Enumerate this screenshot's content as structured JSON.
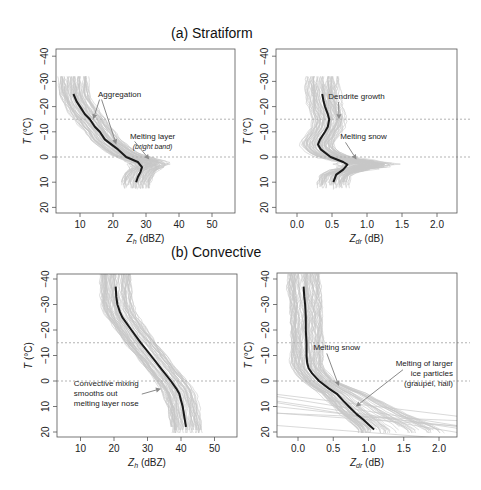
{
  "titles": {
    "top": "(a) Stratiform",
    "bottom": "(b) Convective"
  },
  "colors": {
    "mean_line": "#1a1a1a",
    "ensemble_lines": "#c8c8c8",
    "reference_lines": "#aaaaaa",
    "arrow": "#8a8a8a",
    "axis": "#555555",
    "text": "#222222"
  },
  "chart_data": [
    {
      "id": "stratiform-zh",
      "type": "line",
      "title": "(a) Stratiform",
      "xlabel": "Z_h (dBZ)",
      "xlabel_main": "Z",
      "xlabel_sub": "h",
      "xlabel_unit": " (dBZ)",
      "ylabel": "T (°C)",
      "xlim": [
        3,
        57
      ],
      "ylim": [
        22,
        -43
      ],
      "x_ticks": [
        10,
        20,
        30,
        40,
        50
      ],
      "x_tick_labels": [
        "10",
        "20",
        "30",
        "40",
        "50"
      ],
      "y_ticks": [
        -40,
        -30,
        -20,
        -10,
        0,
        10,
        20
      ],
      "y_tick_labels": [
        "-40",
        "-30",
        "-20",
        "-10",
        "0",
        "10",
        "20"
      ],
      "reference_lines_T": [
        -15,
        0
      ],
      "grid": false,
      "series": [
        {
          "name": "mean profile",
          "T": [
            -25,
            -22,
            -20,
            -17,
            -15,
            -12,
            -10,
            -7,
            -5,
            -3,
            0,
            2,
            4,
            6,
            8,
            10
          ],
          "values": [
            8,
            9,
            10,
            11.5,
            13,
            14.5,
            16,
            17.5,
            19.5,
            21.5,
            24,
            27.5,
            28.8,
            28.3,
            27.5,
            27
          ]
        }
      ],
      "ensemble_spread": {
        "T_range": [
          -32,
          13
        ],
        "x_range": [
          5,
          40
        ]
      },
      "annotations": [
        {
          "text": "Aggregation",
          "x": 22,
          "y": -24,
          "arrows_to": [
            [
              14,
              -15
            ],
            [
              21,
              -5
            ]
          ]
        },
        {
          "text": "Melting layer",
          "subtext": "(bright band)",
          "x": 32,
          "y": -7,
          "arrows_to": [
            [
              31,
              1
            ]
          ]
        }
      ]
    },
    {
      "id": "stratiform-zdr",
      "type": "line",
      "title": "(a) Stratiform",
      "xlabel": "Z_dr (dB)",
      "xlabel_main": "Z",
      "xlabel_sub": "dr",
      "xlabel_unit": " (dB)",
      "ylabel": "T (°C)",
      "xlim": [
        -0.3,
        2.3
      ],
      "ylim": [
        22,
        -43
      ],
      "x_ticks": [
        0.0,
        0.5,
        1.0,
        1.5,
        2.0
      ],
      "x_tick_labels": [
        "0.0",
        "0.5",
        "1.0",
        "1.5",
        "2.0"
      ],
      "y_ticks": [
        -40,
        -30,
        -20,
        -10,
        0,
        10,
        20
      ],
      "y_tick_labels": [
        "-40",
        "-30",
        "-20",
        "-10",
        "0",
        "10",
        "20"
      ],
      "reference_lines_T": [
        -15,
        0
      ],
      "grid": false,
      "series": [
        {
          "name": "mean profile",
          "T": [
            -25,
            -22,
            -20,
            -17,
            -15,
            -12,
            -10,
            -7,
            -5,
            -3,
            0,
            2,
            3,
            5,
            7,
            10
          ],
          "values": [
            0.36,
            0.38,
            0.4,
            0.44,
            0.46,
            0.44,
            0.4,
            0.33,
            0.3,
            0.34,
            0.48,
            0.66,
            0.72,
            0.66,
            0.56,
            0.52
          ]
        }
      ],
      "ensemble_spread": {
        "T_range": [
          -32,
          13
        ],
        "x_range": [
          0.0,
          1.5
        ]
      },
      "annotations": [
        {
          "text": "Dendrite growth",
          "x": 0.85,
          "y": -23,
          "arrows_to": [
            [
              0.6,
              -15
            ]
          ]
        },
        {
          "text": "Melting snow",
          "x": 0.95,
          "y": -7,
          "arrows_to": [
            [
              0.85,
              1
            ]
          ]
        }
      ]
    },
    {
      "id": "convective-zh",
      "type": "line",
      "title": "(b) Convective",
      "xlabel": "Z_h (dBZ)",
      "xlabel_main": "Z",
      "xlabel_sub": "h",
      "xlabel_unit": " (dBZ)",
      "ylabel": "T (°C)",
      "xlim": [
        3,
        57
      ],
      "ylim": [
        22,
        -42
      ],
      "x_ticks": [
        10,
        20,
        30,
        40,
        50
      ],
      "x_tick_labels": [
        "10",
        "20",
        "30",
        "40",
        "50"
      ],
      "y_ticks": [
        -40,
        -30,
        -20,
        -10,
        0,
        10,
        20
      ],
      "y_tick_labels": [
        "-40",
        "-30",
        "-20",
        "-10",
        "0",
        "10",
        "20"
      ],
      "reference_lines_T": [
        -15,
        0
      ],
      "grid": false,
      "series": [
        {
          "name": "mean profile",
          "T": [
            -37,
            -33,
            -30,
            -27,
            -25,
            -20,
            -15,
            -10,
            -5,
            0,
            3,
            5,
            8,
            10,
            14,
            18
          ],
          "values": [
            20.5,
            20.7,
            21,
            21.8,
            22.5,
            25.2,
            28,
            31,
            34,
            37,
            38.6,
            39.5,
            40.1,
            40.5,
            41,
            41.5
          ]
        }
      ],
      "ensemble_spread": {
        "T_range": [
          -42,
          21
        ],
        "x_range": [
          15,
          49
        ]
      },
      "annotations": [
        {
          "text": "Convective mixing\nsmooths out\nmelting layer nose",
          "lines": [
            "Convective mixing",
            "smooths out",
            "melting layer nose"
          ],
          "x": 8,
          "y": 2,
          "arrows_to": [
            [
              34,
              3
            ]
          ]
        }
      ]
    },
    {
      "id": "convective-zdr",
      "type": "line",
      "title": "(b) Convective",
      "xlabel": "Z_dr (dB)",
      "xlabel_main": "Z",
      "xlabel_sub": "dr",
      "xlabel_unit": " (dB)",
      "ylabel": "T (°C)",
      "xlim": [
        -0.3,
        2.3
      ],
      "ylim": [
        22,
        -42
      ],
      "x_ticks": [
        0.0,
        0.5,
        1.0,
        1.5,
        2.0
      ],
      "x_tick_labels": [
        "0.0",
        "0.5",
        "1.0",
        "1.5",
        "2.0"
      ],
      "y_ticks": [
        -40,
        -30,
        -20,
        -10,
        0,
        10,
        20
      ],
      "y_tick_labels": [
        "-40",
        "-30",
        "-20",
        "-10",
        "0",
        "10",
        "20"
      ],
      "reference_lines_T": [
        -15,
        0
      ],
      "grid": false,
      "series": [
        {
          "name": "mean profile",
          "T": [
            -37,
            -33,
            -30,
            -25,
            -20,
            -15,
            -10,
            -7,
            -5,
            -3,
            0,
            3,
            5,
            8,
            10,
            13,
            15,
            17,
            19
          ],
          "values": [
            0.08,
            0.09,
            0.1,
            0.11,
            0.11,
            0.12,
            0.12,
            0.13,
            0.15,
            0.2,
            0.3,
            0.44,
            0.55,
            0.65,
            0.72,
            0.83,
            0.92,
            1.0,
            1.08
          ]
        }
      ],
      "ensemble_spread": {
        "T_range": [
          -42,
          21
        ],
        "x_range": [
          -0.3,
          2.3
        ]
      },
      "annotations": [
        {
          "text": "Melting snow",
          "x": 0.55,
          "y": -12,
          "arrows_to": [
            [
              0.58,
              2
            ]
          ]
        },
        {
          "text": "Melting of larger\nice particles\n(graupel, hail)",
          "lines": [
            "Melting of larger",
            "ice particles",
            "(graupel, hail)"
          ],
          "x": 1.7,
          "y": -6,
          "arrows_to": [
            [
              0.82,
              10
            ]
          ]
        }
      ]
    }
  ]
}
